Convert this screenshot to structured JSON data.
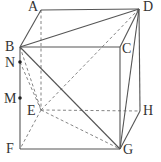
{
  "diagram": {
    "type": "cube-geometry",
    "stroke_color": "#555555",
    "dashed_color": "#777777",
    "vertices": {
      "A": {
        "x": 41,
        "y": 10
      },
      "D": {
        "x": 139,
        "y": 9
      },
      "B": {
        "x": 20,
        "y": 47
      },
      "C": {
        "x": 120,
        "y": 47
      },
      "E": {
        "x": 41,
        "y": 110
      },
      "H": {
        "x": 140,
        "y": 111
      },
      "F": {
        "x": 20,
        "y": 149
      },
      "G": {
        "x": 120,
        "y": 149
      },
      "N": {
        "x": 20,
        "y": 62
      },
      "M": {
        "x": 20,
        "y": 98
      }
    },
    "labels": {
      "A": "A",
      "B": "B",
      "C": "C",
      "D": "D",
      "E": "E",
      "F": "F",
      "G": "G",
      "H": "H",
      "M": "M",
      "N": "N"
    },
    "solid_edges": [
      [
        "A",
        "D"
      ],
      [
        "A",
        "B"
      ],
      [
        "B",
        "C"
      ],
      [
        "C",
        "D"
      ],
      [
        "B",
        "F"
      ],
      [
        "F",
        "G"
      ],
      [
        "C",
        "G"
      ],
      [
        "D",
        "H"
      ],
      [
        "G",
        "H"
      ],
      [
        "B",
        "D"
      ],
      [
        "B",
        "G"
      ],
      [
        "D",
        "G"
      ]
    ],
    "dashed_edges": [
      [
        "A",
        "E"
      ],
      [
        "E",
        "F"
      ],
      [
        "E",
        "H"
      ],
      [
        "E",
        "D"
      ],
      [
        "E",
        "G"
      ],
      [
        "B",
        "E"
      ],
      [
        "N",
        "E"
      ]
    ],
    "points": [
      "N",
      "M"
    ]
  }
}
